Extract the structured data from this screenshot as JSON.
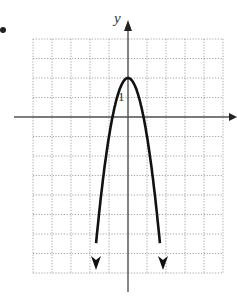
{
  "chart_data": {
    "type": "line",
    "title": "",
    "xlabel": "x",
    "ylabel": "y",
    "tick_labels": [
      {
        "axis": "y",
        "value": 1,
        "label": "1"
      }
    ],
    "grid": true,
    "grid_style": "dotted",
    "xlim": [
      -5,
      5
    ],
    "ylim": [
      -8,
      4
    ],
    "series": [
      {
        "name": "parabola",
        "equation": "y = -3x^2 + 2",
        "vertex": [
          0,
          2
        ],
        "opens": "down",
        "arrows": "both ends",
        "x": [
          -1.7,
          -1.5,
          -1.0,
          -0.8,
          -0.5,
          0,
          0.5,
          0.8,
          1.0,
          1.5,
          1.7
        ],
        "values": [
          -6.67,
          -4.75,
          -1.0,
          0.08,
          1.25,
          2.0,
          1.25,
          0.08,
          -1.0,
          -4.75,
          -6.67
        ]
      }
    ]
  },
  "labels": {
    "y_axis": "y",
    "tick_one": "1"
  }
}
